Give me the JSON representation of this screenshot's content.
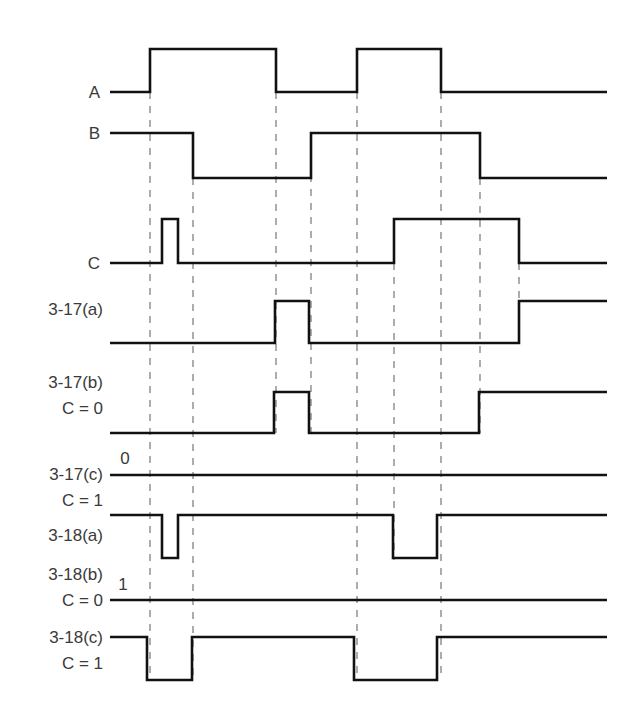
{
  "diagram": {
    "type": "timing-diagram",
    "x_start": 110,
    "x_end": 607,
    "dashed_lines": [
      {
        "x": 150,
        "y1": 92,
        "y2": 680
      },
      {
        "x": 193,
        "y1": 178,
        "y2": 680
      },
      {
        "x": 276,
        "y1": 92,
        "y2": 433
      },
      {
        "x": 311,
        "y1": 133,
        "y2": 433
      },
      {
        "x": 357,
        "y1": 92,
        "y2": 680
      },
      {
        "x": 394,
        "y1": 263,
        "y2": 560
      },
      {
        "x": 441,
        "y1": 92,
        "y2": 680
      },
      {
        "x": 480,
        "y1": 178,
        "y2": 433
      },
      {
        "x": 519,
        "y1": 263,
        "y2": 343
      }
    ],
    "signals": [
      {
        "id": "A",
        "labels": [
          "A"
        ],
        "label_x": 100,
        "label_y": [
          98
        ],
        "high_y": 49,
        "low_y": 92,
        "initial": 0,
        "transitions": [
          150,
          276,
          357,
          441
        ]
      },
      {
        "id": "B",
        "labels": [
          "B"
        ],
        "label_x": 100,
        "label_y": [
          139
        ],
        "high_y": 133,
        "low_y": 178,
        "initial": 1,
        "transitions": [
          193,
          311,
          480
        ]
      },
      {
        "id": "C",
        "labels": [
          "C"
        ],
        "label_x": 100,
        "label_y": [
          269
        ],
        "high_y": 219,
        "low_y": 263,
        "initial": 0,
        "transitions": [
          162,
          178,
          394,
          519
        ]
      },
      {
        "id": "3-17a",
        "labels": [
          "3-17(a)"
        ],
        "label_x": 103,
        "label_y": [
          315
        ],
        "high_y": 301,
        "low_y": 343,
        "initial": 0,
        "transitions": [
          275,
          309,
          519
        ]
      },
      {
        "id": "3-17b",
        "labels": [
          "3-17(b)",
          "C = 0"
        ],
        "label_x": 103,
        "label_y": [
          388,
          414
        ],
        "high_y": 392,
        "low_y": 433,
        "initial": 0,
        "transitions": [
          274,
          309,
          479
        ]
      },
      {
        "id": "3-17c",
        "labels": [
          "3-17(c)",
          "C = 1"
        ],
        "label_x": 103,
        "label_y": [
          480,
          506
        ],
        "high_y": 475,
        "low_y": 475,
        "initial": 0,
        "level_text": "0",
        "level_text_x": 125,
        "level_text_y": 464,
        "transitions": []
      },
      {
        "id": "3-18a",
        "labels": [
          "3-18(a)"
        ],
        "label_x": 103,
        "label_y": [
          541
        ],
        "high_y": 515,
        "low_y": 558,
        "initial": 1,
        "transitions": [
          162,
          178,
          393,
          437
        ]
      },
      {
        "id": "3-18b",
        "labels": [
          "3-18(b)",
          "C = 0"
        ],
        "label_x": 103,
        "label_y": [
          580,
          606
        ],
        "high_y": 600,
        "low_y": 600,
        "initial": 1,
        "level_text": "1",
        "level_text_x": 123,
        "level_text_y": 590,
        "transitions": []
      },
      {
        "id": "3-18c",
        "labels": [
          "3-18(c)",
          "C = 1"
        ],
        "label_x": 103,
        "label_y": [
          643,
          669
        ],
        "high_y": 637,
        "low_y": 680,
        "initial": 1,
        "transitions": [
          147,
          192,
          354,
          437
        ]
      }
    ]
  }
}
